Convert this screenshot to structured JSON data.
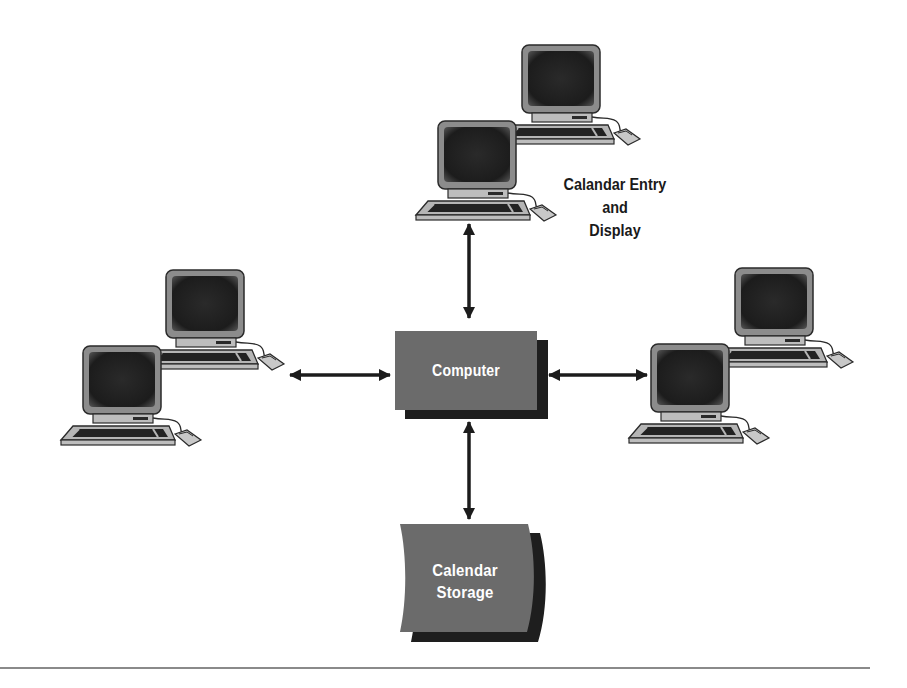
{
  "diagram": {
    "type": "network-diagram",
    "colors": {
      "box_fill": "#6b6b6b",
      "box_shadow": "#1e1e1e",
      "screen": "#1f1f1f",
      "bezel": "#8c8c8c",
      "case": "#bdbdbd",
      "arrow": "#1c1c1c",
      "rule": "#8a8a8a"
    },
    "nodes": {
      "computer": {
        "label": "Computer",
        "shape": "shadowed-box"
      },
      "storage": {
        "label_line1": "Calendar",
        "label_line2": "Storage",
        "shape": "drum"
      }
    },
    "workstation_groups": [
      {
        "id": "top",
        "count": 2,
        "caption_line1": "Calandar Entry",
        "caption_line2": "and",
        "caption_line3": "Display"
      },
      {
        "id": "left",
        "count": 2
      },
      {
        "id": "right",
        "count": 2
      }
    ],
    "connections": [
      {
        "from": "top-workstations",
        "to": "computer",
        "type": "bidirectional"
      },
      {
        "from": "left-workstations",
        "to": "computer",
        "type": "bidirectional"
      },
      {
        "from": "right-workstations",
        "to": "computer",
        "type": "bidirectional"
      },
      {
        "from": "computer",
        "to": "storage",
        "type": "bidirectional"
      }
    ]
  }
}
